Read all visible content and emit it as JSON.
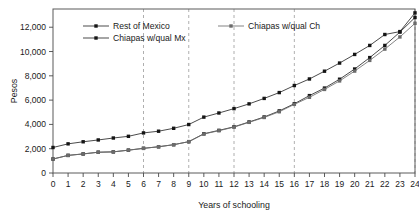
{
  "chart_data": {
    "type": "line",
    "title": "",
    "xlabel": "Years of schooling",
    "ylabel": "Pesos",
    "x": [
      0,
      1,
      2,
      3,
      4,
      5,
      6,
      7,
      8,
      9,
      10,
      11,
      12,
      13,
      14,
      15,
      16,
      17,
      18,
      19,
      20,
      21,
      22,
      23,
      24
    ],
    "xlim": [
      0,
      24
    ],
    "ylim": [
      0,
      13500
    ],
    "y_ticks": [
      0,
      2000,
      4000,
      6000,
      8000,
      10000,
      12000
    ],
    "y_tick_labels": [
      "0",
      "2,000",
      "4,000",
      "6,000",
      "8,000",
      "10,000",
      "12,000"
    ],
    "x_ticks": [
      0,
      1,
      2,
      3,
      4,
      5,
      6,
      7,
      8,
      9,
      10,
      11,
      12,
      13,
      14,
      15,
      16,
      17,
      18,
      19,
      20,
      21,
      22,
      23,
      24
    ],
    "x_tick_labels": [
      "0",
      "1",
      "2",
      "3",
      "4",
      "5",
      "6",
      "7",
      "8",
      "9",
      "10",
      "11",
      "12",
      "13",
      "14",
      "15",
      "16",
      "17",
      "18",
      "19",
      "20",
      "21",
      "22",
      "23",
      "24"
    ],
    "grid": "vertical-dashed",
    "gridlines_x": [
      6,
      9,
      12,
      16,
      24
    ],
    "legend_position": "top-inside",
    "series": [
      {
        "name": "Rest of Mexico",
        "color": "#2a2a2a",
        "marker": "square",
        "values": [
          2100,
          2400,
          2570,
          2720,
          2880,
          3020,
          3300,
          3440,
          3680,
          3990,
          4600,
          4940,
          5300,
          5690,
          6140,
          6620,
          7200,
          7740,
          8380,
          9050,
          9760,
          10500,
          11400,
          11640,
          13180
        ]
      },
      {
        "name": "Chiapas w/qual Mx",
        "color": "#2a2a2a",
        "marker": "square",
        "values": [
          1150,
          1450,
          1570,
          1710,
          1740,
          1880,
          2030,
          2160,
          2330,
          2580,
          3230,
          3510,
          3800,
          4200,
          4610,
          5110,
          5700,
          6370,
          6990,
          7720,
          8560,
          9500,
          10500,
          11600,
          12800
        ]
      },
      {
        "name": "Chiapas w/qual Ch",
        "color": "#6b6b6b",
        "marker": "square",
        "values": [
          1150,
          1450,
          1570,
          1710,
          1740,
          1880,
          2030,
          2160,
          2330,
          2580,
          3210,
          3480,
          3780,
          4170,
          4570,
          5040,
          5650,
          6230,
          6880,
          7580,
          8390,
          9270,
          10200,
          11200,
          12320
        ]
      }
    ]
  },
  "axes": {
    "y_label": "Pesos",
    "x_label": "Years of schooling"
  },
  "legend": {
    "entries": [
      {
        "label": "Rest of Mexico"
      },
      {
        "label": "Chiapas w/qual Ch"
      },
      {
        "label": "Chiapas w/qual Mx"
      }
    ]
  }
}
